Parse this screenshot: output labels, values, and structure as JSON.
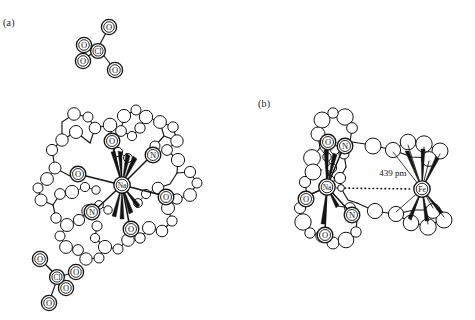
{
  "figure": {
    "background_color": "#ffffff",
    "line_color": "#141414",
    "width": 475,
    "height": 320
  },
  "panels": [
    {
      "id": "a",
      "label": "(a)",
      "description": "Sodium cryptate cation with two perchlorate counter-anions"
    },
    {
      "id": "b",
      "label": "(b)",
      "description": "Sodium cryptate ferrocene adduct showing the sodium-iron separation"
    }
  ],
  "panel_a": {
    "label": "(a)",
    "anions": [
      {
        "name": "perchlorate-top",
        "central_atom": "Cl",
        "ligand_atoms": [
          "O",
          "O",
          "O",
          "O"
        ]
      },
      {
        "name": "perchlorate-bottom",
        "central_atom": "Cl",
        "ligand_atoms": [
          "O",
          "O",
          "O",
          "O"
        ]
      }
    ],
    "cryptate": {
      "name": "sodium-cryptate-a",
      "metal_center": "Na",
      "donor_atoms": [
        "O",
        "O",
        "O",
        "O",
        "N",
        "N"
      ]
    }
  },
  "panel_b": {
    "label": "(b)",
    "cryptate": {
      "name": "sodium-cryptate-b",
      "metal_center": "Na",
      "donor_atoms": [
        "O",
        "O",
        "O",
        "N",
        "N"
      ]
    },
    "ferrocene": {
      "name": "ferrocene",
      "metal_center": "Fe"
    },
    "distance": {
      "value": "439 pm",
      "from": "Na",
      "to": "Fe"
    }
  },
  "atom_labels": {
    "oxygen": "O",
    "nitrogen": "N",
    "chlorine": "Cl",
    "sodium": "Na",
    "iron": "Fe"
  }
}
